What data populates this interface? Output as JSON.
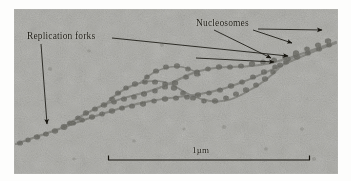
{
  "figure": {
    "type": "electron-micrograph",
    "background_color": "#a9a9a4",
    "ink_color": "#17150f"
  },
  "annotations": {
    "replication_forks": {
      "label": "Replication forks",
      "arrow_count": 2
    },
    "nucleosomes": {
      "label": "Nucleosomes",
      "arrow_count": 3
    }
  },
  "scalebar": {
    "label": "1µm",
    "x_start": 108,
    "x_end": 310,
    "y": 160
  }
}
